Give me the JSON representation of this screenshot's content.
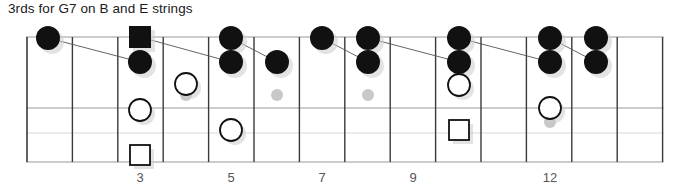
{
  "title": "3rds for G7 on B and E strings",
  "diagram": {
    "kind": "guitar-fretboard",
    "geometry": {
      "nut_x": 27,
      "fret_spacing": 45.4,
      "fret_count": 14,
      "top_string_y": 37,
      "bottom_edge_y": 162,
      "string_rows_y": [
        37,
        108,
        133,
        162
      ]
    },
    "colors": {
      "fret_line": "#3a3a3a",
      "string_line": "#9a9a9a",
      "string_line_faint": "#d8d8d8",
      "marker_fill": "#111111",
      "marker_open": "#ffffff",
      "marker_stroke": "#111111",
      "inlay_dot": "#c8c8c8",
      "shadow": "#cccccc",
      "connector": "#555555",
      "text": "#1a1a1a",
      "fretnum_text": "#555555",
      "background": "#ffffff"
    },
    "fret_numbers": [
      {
        "label": "3",
        "x": 140
      },
      {
        "label": "5",
        "x": 231
      },
      {
        "label": "7",
        "x": 322
      },
      {
        "label": "9",
        "x": 413
      },
      {
        "label": "12",
        "x": 550
      }
    ],
    "inlay_dots": [
      {
        "fret": 5,
        "cx": 186,
        "cy": 95,
        "r": 6
      },
      {
        "fret": 7,
        "cx": 277,
        "cy": 95,
        "r": 6
      },
      {
        "fret": 9,
        "cx": 368,
        "cy": 95,
        "r": 6
      },
      {
        "fret": 12,
        "cx": 550,
        "cy": 68,
        "r": 6
      },
      {
        "fret": 12,
        "cx": 550,
        "cy": 122,
        "r": 6
      }
    ],
    "markers": [
      {
        "id": "m1",
        "shape": "filled-circle",
        "cx": 48,
        "cy": 38,
        "r": 12
      },
      {
        "id": "m2",
        "shape": "filled-square",
        "cx": 140,
        "cy": 37,
        "r": 11
      },
      {
        "id": "m3",
        "shape": "filled-circle",
        "cx": 140,
        "cy": 62,
        "r": 12
      },
      {
        "id": "m4",
        "shape": "open-circle",
        "cx": 186,
        "cy": 84,
        "r": 11
      },
      {
        "id": "m5",
        "shape": "open-circle",
        "cx": 140,
        "cy": 110,
        "r": 11
      },
      {
        "id": "m6",
        "shape": "open-square",
        "cx": 140,
        "cy": 155,
        "r": 10
      },
      {
        "id": "m7",
        "shape": "filled-circle",
        "cx": 231,
        "cy": 38,
        "r": 12
      },
      {
        "id": "m8",
        "shape": "filled-circle",
        "cx": 231,
        "cy": 62,
        "r": 12
      },
      {
        "id": "m9",
        "shape": "open-circle",
        "cx": 231,
        "cy": 130,
        "r": 11
      },
      {
        "id": "m10",
        "shape": "filled-circle",
        "cx": 277,
        "cy": 62,
        "r": 12
      },
      {
        "id": "m11",
        "shape": "filled-circle",
        "cx": 322,
        "cy": 38,
        "r": 12
      },
      {
        "id": "m12",
        "shape": "filled-circle",
        "cx": 368,
        "cy": 38,
        "r": 12
      },
      {
        "id": "m13",
        "shape": "filled-circle",
        "cx": 368,
        "cy": 62,
        "r": 12
      },
      {
        "id": "m14",
        "shape": "filled-circle",
        "cx": 459,
        "cy": 38,
        "r": 12
      },
      {
        "id": "m15",
        "shape": "filled-circle",
        "cx": 459,
        "cy": 62,
        "r": 12
      },
      {
        "id": "m16",
        "shape": "open-circle",
        "cx": 459,
        "cy": 85,
        "r": 11
      },
      {
        "id": "m17",
        "shape": "open-square",
        "cx": 459,
        "cy": 130,
        "r": 10
      },
      {
        "id": "m18",
        "shape": "filled-circle",
        "cx": 550,
        "cy": 38,
        "r": 12
      },
      {
        "id": "m19",
        "shape": "filled-circle",
        "cx": 550,
        "cy": 62,
        "r": 12
      },
      {
        "id": "m20",
        "shape": "open-circle",
        "cx": 550,
        "cy": 108,
        "r": 11
      },
      {
        "id": "m21",
        "shape": "filled-circle",
        "cx": 596,
        "cy": 38,
        "r": 12
      },
      {
        "id": "m22",
        "shape": "filled-circle",
        "cx": 596,
        "cy": 62,
        "r": 12
      }
    ],
    "connectors": [
      {
        "x1": 48,
        "y1": 38,
        "x2": 140,
        "y2": 62
      },
      {
        "x1": 140,
        "y1": 37,
        "x2": 231,
        "y2": 62
      },
      {
        "x1": 231,
        "y1": 38,
        "x2": 277,
        "y2": 62
      },
      {
        "x1": 322,
        "y1": 38,
        "x2": 368,
        "y2": 62
      },
      {
        "x1": 368,
        "y1": 38,
        "x2": 459,
        "y2": 62
      },
      {
        "x1": 459,
        "y1": 38,
        "x2": 550,
        "y2": 62
      },
      {
        "x1": 550,
        "y1": 38,
        "x2": 596,
        "y2": 62
      }
    ]
  }
}
